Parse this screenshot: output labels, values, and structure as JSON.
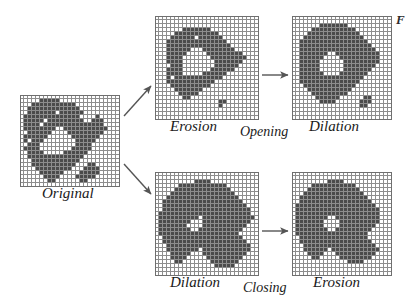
{
  "figure": {
    "background_color": "#ffffff",
    "fill_color": "#4b4b4b",
    "grid_line_color": "#8d8d8d",
    "arrow_color": "#555555"
  },
  "labels": {
    "original": "Original",
    "erosion_top": "Erosion",
    "opening": "Opening",
    "dilation_top": "Dilation",
    "dilation_bottom": "Dilation",
    "closing": "Closing",
    "erosion_bottom": "Erosion",
    "corner_mark": "F"
  },
  "panels": {
    "original": {
      "name": "Original",
      "cols": 25,
      "rows": 23,
      "x": 20,
      "y": 95,
      "cell": 4,
      "rows_data": [
        "0000000000000000000000000",
        "0000011111000000000000000",
        "0001111111111100000000000",
        "0011111111111110000000000",
        "0011111110111111000000000",
        "0111111111111110000100000",
        "0111110111111111001110000",
        "0111101111111111111110000",
        "0111111110011111111111000",
        "0011111100001111111110000",
        "0111111000000111111100000",
        "0101110000000011111000000",
        "0011100000000011110000000",
        "0111100000000111110000000",
        "0011110000011111100000000",
        "0011111111111111000000000",
        "0001111111111110000000000",
        "0001111111111100011000000",
        "0000111111111000111100000",
        "0000011111100001111100000",
        "0000001111000011111000000",
        "0000000110000001100000000",
        "0000000000000000000000000"
      ]
    },
    "erosion_top": {
      "name": "Erosion",
      "cols": 26,
      "rows": 26,
      "x": 155,
      "y": 16,
      "cell": 4,
      "rows_data": [
        "00000000000000000000000000",
        "00000000000000000000000000",
        "00000000000000000000000000",
        "00000001111111000000000000",
        "00000111111111110000000000",
        "00001111110111111000000000",
        "00011111111111111100000000",
        "00011111111111111110000000",
        "00011111100011111111000000",
        "00011111000001111111110000",
        "00011110000000111111111000",
        "00011110000000011111110000",
        "00001110000000011111100000",
        "00011110000000111111000000",
        "00011110000011111100000000",
        "00010111111111111000000000",
        "00011111111111100000000000",
        "00001111111111000000000000",
        "00000111111100000000000000",
        "00000011111000000000000000",
        "00000001100000000000000000",
        "00000000000000001100000000",
        "00000000000000001000000000",
        "00000000000000000000000000",
        "00000000000000000000000000",
        "00000000000000000000000000"
      ]
    },
    "dilation_top": {
      "name": "Dilation",
      "cols": 25,
      "rows": 26,
      "x": 292,
      "y": 16,
      "cell": 4,
      "rows_data": [
        "0000000000000000000000000",
        "0000000000000000000000000",
        "0000000111111100000000000",
        "0000011111111111000000000",
        "0000111111111111100000000",
        "0001111111111111110000000",
        "0011111111111111111000000",
        "0011111111111111111100000",
        "0011111111111111111110000",
        "0011111110011111111111000",
        "0011111100001111111111000",
        "0011111000000111111111000",
        "0011111000000111111110000",
        "0011111000000111111100000",
        "0011111100001111111000000",
        "0011111111111111110000000",
        "0011111111111111100000000",
        "0001111111111111000000000",
        "0000111111111110000000000",
        "0000011111111100000000000",
        "0000001111110000001100000",
        "0000000111100000011100000",
        "0000000000000000011000000",
        "0000000000000000000000000",
        "0000000000000000000000000",
        "0000000000000000000000000"
      ]
    },
    "dilation_bottom": {
      "name": "Dilation",
      "cols": 26,
      "rows": 26,
      "x": 155,
      "y": 172,
      "cell": 4,
      "rows_data": [
        "00000000000000000000000000",
        "00000000000000000000000000",
        "00000000001111000000000000",
        "00000011111111111100000000",
        "00000111111111111110000000",
        "00001111111111111111000000",
        "00011111111111111111100000",
        "00111111111111111111110000",
        "00111111111111111111111000",
        "00111111111111111111111100",
        "01111111111111111111111100",
        "01111111111011111111111110",
        "01111111100011111111111100",
        "01111111000011111111111000",
        "01111111100111111111110000",
        "01111111111111111111100000",
        "00111111111111111111110000",
        "00111111111111111111111000",
        "00011111111111111111111100",
        "00011111111011111111111100",
        "00001111100011111111111000",
        "00001111000001111111110000",
        "00000110000000111111100000",
        "00000000000000011111000000",
        "00000000000000000000000000",
        "00000000000000000000000000"
      ]
    },
    "erosion_bottom": {
      "name": "Erosion",
      "cols": 25,
      "rows": 26,
      "x": 292,
      "y": 172,
      "cell": 4,
      "rows_data": [
        "0000000000000000000000000",
        "0000000000000000000000000",
        "0000000001111000000000000",
        "0000011111111111000000000",
        "0000111111111111100000000",
        "0001111111111111110000000",
        "0011111111111111111000000",
        "0011111111111111111100000",
        "0111111111111111111110000",
        "0111111111111111111111000",
        "0111111111111111111111000",
        "0111111110011111111111000",
        "0111111100001111111111000",
        "0111111100001111111110000",
        "0111111110011111111100000",
        "0111111111111111111000000",
        "0011111111111111111000000",
        "0011111111111111111100000",
        "0001111111111111111110000",
        "0001111110111111111111000",
        "0000111100011111111110000",
        "0000011000001111111100000",
        "0000000000000011110000000",
        "0000000000000000000000000",
        "0000000000000000000000000",
        "0000000000000000000000000"
      ]
    }
  },
  "label_positions": {
    "original": {
      "x": 42,
      "y": 185
    },
    "erosion_top": {
      "x": 170,
      "y": 118
    },
    "opening": {
      "x": 240,
      "y": 124
    },
    "dilation_top": {
      "x": 309,
      "y": 118
    },
    "dilation_bottom": {
      "x": 170,
      "y": 274
    },
    "closing": {
      "x": 243,
      "y": 280
    },
    "erosion_bottom": {
      "x": 313,
      "y": 274
    }
  },
  "arrows": [
    {
      "name": "original-to-erosion",
      "x1": 124,
      "y1": 116,
      "x2": 151,
      "y2": 86
    },
    {
      "name": "erosion-to-dilation",
      "x1": 262,
      "y1": 75,
      "x2": 288,
      "y2": 75
    },
    {
      "name": "original-to-dilation",
      "x1": 124,
      "y1": 164,
      "x2": 151,
      "y2": 194
    },
    {
      "name": "dilation-to-erosion-bottom",
      "x1": 262,
      "y1": 231,
      "x2": 288,
      "y2": 231
    }
  ]
}
